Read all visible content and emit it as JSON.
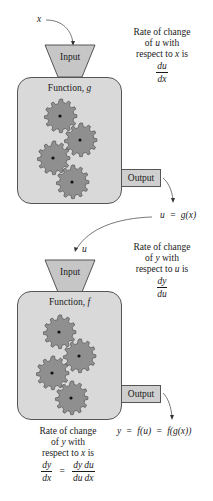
{
  "stage_g": {
    "input_variable": "x",
    "input_label": "Input",
    "function_label": "Function, ",
    "function_name": "g",
    "output_label": "Output",
    "output_expression": {
      "lhs": "u",
      "eq": "=",
      "rhs": "g(x)"
    },
    "rate_text": {
      "line1": "Rate of change",
      "line2_pre": "of ",
      "line2_var": "u",
      "line2_post": " with",
      "line3_pre": "respect to ",
      "line3_var": "x",
      "line3_post": " is",
      "frac_num": "du",
      "frac_den": "dx"
    }
  },
  "stage_f": {
    "input_variable": "u",
    "input_label": "Input",
    "function_label": "Function, ",
    "function_name": "f",
    "output_label": "Output",
    "output_expression": {
      "lhs": "y",
      "eq1": "=",
      "mid": "f(u)",
      "eq2": "=",
      "rhs": "f(g(x))"
    },
    "rate_text": {
      "line1": "Rate of change",
      "line2_pre": "of ",
      "line2_var": "y",
      "line2_post": " with",
      "line3_pre": "respect to ",
      "line3_var": "u",
      "line3_post": " is",
      "frac_num": "dy",
      "frac_den": "du"
    }
  },
  "chain_rule": {
    "line1": "Rate of change",
    "line2_pre": "of ",
    "line2_var": "y",
    "line2_post": " with",
    "line3_pre": "respect to ",
    "line3_var": "x",
    "line3_post": " is",
    "lhs_num": "dy",
    "lhs_den": "dx",
    "eq": "=",
    "r1_num": "dy",
    "r1_den": "du",
    "r2_num": "du",
    "r2_den": "dx"
  },
  "colors": {
    "box_fill": "#d9d9d9",
    "gear_fill": "#8f8f8f",
    "stroke": "#555555",
    "text": "#1a1a1a"
  }
}
